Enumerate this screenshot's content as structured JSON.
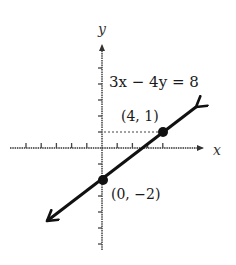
{
  "chart_data": {
    "type": "line",
    "title": "",
    "equation": "3x − 4y = 8",
    "xlabel": "x",
    "ylabel": "y",
    "xlim": [
      -5,
      5
    ],
    "ylim": [
      -6,
      5
    ],
    "grid": false,
    "legend": null,
    "series": [
      {
        "name": "3x − 4y = 8",
        "x": [
          -4,
          0,
          4,
          6
        ],
        "y": [
          -5,
          -2,
          1,
          2.5
        ],
        "arrows_both_ends": true
      }
    ],
    "points": [
      {
        "x": 4,
        "y": 1,
        "label": "(4, 1)"
      },
      {
        "x": 0,
        "y": -2,
        "label": "(0, −2)"
      }
    ],
    "annotations": [
      {
        "type": "dotted-guide",
        "from": [
          0,
          1
        ],
        "to": [
          4,
          1
        ]
      }
    ],
    "x_ticks": [
      -5,
      -4,
      -3,
      -2,
      -1,
      1,
      2,
      3,
      4
    ],
    "y_ticks": [
      5,
      4,
      3,
      2,
      1,
      -1,
      -2,
      -3,
      -4,
      -5,
      -6
    ]
  },
  "labels": {
    "x_axis": "x",
    "y_axis": "y",
    "equation": "3x − 4y = 8",
    "point_a": "(4, 1)",
    "point_b": "(0, −2)"
  },
  "colors": {
    "ink": "#111111",
    "axis": "#333333",
    "background": "#ffffff"
  }
}
